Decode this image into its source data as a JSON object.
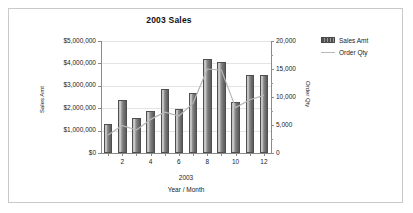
{
  "chart_data": {
    "type": "bar",
    "title": "2003 Sales",
    "xlabel": "Year / Month",
    "ylabel": "Sales Amt",
    "y2label": "Order Qty",
    "categories": [
      "1",
      "2",
      "3",
      "4",
      "5",
      "6",
      "7",
      "8",
      "9",
      "10",
      "11",
      "12"
    ],
    "visible_tick_labels": [
      "",
      "2",
      "",
      "4",
      "",
      "6",
      "",
      "8",
      "",
      "10",
      "",
      "12"
    ],
    "group_label": "2003",
    "ylim": [
      0,
      5000000
    ],
    "y2lim": [
      0,
      20000
    ],
    "ytick_labels": [
      "$0",
      "$1,000,000",
      "$2,000,000",
      "$3,000,000",
      "$4,000,000",
      "$5,000,000"
    ],
    "ytick_values": [
      0,
      1000000,
      2000000,
      3000000,
      4000000,
      5000000
    ],
    "y2tick_labels": [
      "0",
      "5,000",
      "10,000",
      "15,000",
      "20,000"
    ],
    "y2tick_values": [
      0,
      5000,
      10000,
      15000,
      20000
    ],
    "y2_minor_step": 2500,
    "grid": true,
    "legend_position": "right",
    "series": [
      {
        "name": "Sales Amt",
        "type": "bar",
        "axis": "left",
        "color": "#6e6e6e",
        "values": [
          1300000,
          2350000,
          1550000,
          1870000,
          2880000,
          1980000,
          2670000,
          4200000,
          4050000,
          2280000,
          3470000,
          3500000
        ]
      },
      {
        "name": "Order Qty",
        "type": "line",
        "axis": "right",
        "color": "#b7b7b7",
        "values": [
          3200,
          4900,
          4100,
          6000,
          7300,
          6600,
          8900,
          15000,
          14800,
          8100,
          9500,
          10300
        ]
      }
    ]
  },
  "legend": {
    "items": [
      {
        "label": "Sales Amt",
        "swatch": "bar-swatch"
      },
      {
        "label": "Order Qty",
        "swatch": "line-swatch"
      }
    ]
  },
  "colors": {
    "frame_border": "#c9c9c9",
    "background": "#ffffff",
    "axis": "#8a8a8a",
    "gridline": "#e4e4e4",
    "bar_fill": "#6e6e6e",
    "line_stroke": "#b7b7b7",
    "text": "#1a1a1a"
  }
}
